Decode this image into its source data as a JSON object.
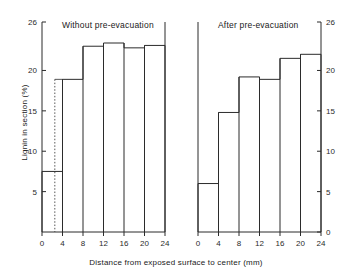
{
  "figure": {
    "xlabel": "Distance from exposed surface to center (mm)",
    "ylabel": "Lignin in section (%)"
  },
  "chart_data": {
    "type": "bar",
    "title": "",
    "xlabel": "Distance from exposed surface to center (mm)",
    "ylabel": "Lignin in section (%)",
    "xlim": [
      0,
      24
    ],
    "ylim": [
      0,
      26
    ],
    "grid": false,
    "legend": null,
    "xticks": [
      "0",
      "4",
      "8",
      "12",
      "16",
      "20",
      "24"
    ],
    "xtick_values": [
      0,
      4,
      8,
      12,
      16,
      20,
      24
    ],
    "panels": [
      {
        "name": "without-pre-evacuation",
        "title": "Without pre-evacuation",
        "yaxis_side": "left",
        "yticks": [
          "5",
          "10",
          "15",
          "20",
          "26"
        ],
        "ytick_values": [
          5,
          10,
          15,
          20,
          26
        ],
        "categories": [
          "0-4",
          "4-8",
          "8-12",
          "12-16",
          "16-20",
          "20-24"
        ],
        "bin_edges": [
          0,
          4,
          8,
          12,
          16,
          20,
          24
        ],
        "values": [
          7.5,
          18.9,
          23.0,
          23.4,
          22.8,
          23.1
        ],
        "annotation": {
          "type": "dashed-vertical-line",
          "x": 2.5
        }
      },
      {
        "name": "after-pre-evacuation",
        "title": "After pre-evacuation",
        "yaxis_side": "right",
        "yticks": [
          "0",
          "5",
          "10",
          "15",
          "20",
          "26"
        ],
        "ytick_values": [
          0,
          5,
          10,
          15,
          20,
          26
        ],
        "categories": [
          "0-4",
          "4-8",
          "8-12",
          "12-16",
          "16-20",
          "20-24"
        ],
        "bin_edges": [
          0,
          4,
          8,
          12,
          16,
          20,
          24
        ],
        "values": [
          6.0,
          14.8,
          19.2,
          18.9,
          21.5,
          22.0
        ]
      }
    ]
  },
  "axis_labels": {
    "left_panel_y": [
      "26",
      "20",
      "15",
      "10",
      "5"
    ],
    "right_panel_y": [
      "26",
      "20",
      "15",
      "10",
      "5",
      "0"
    ],
    "x": [
      "0",
      "4",
      "8",
      "12",
      "16",
      "20",
      "24"
    ]
  }
}
